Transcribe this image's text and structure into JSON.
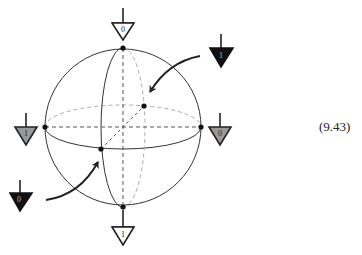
{
  "figure": {
    "type": "bloch-sphere-diagram",
    "equation_number": "(9.43)",
    "sphere": {
      "cx": 123,
      "cy": 127,
      "r": 78
    },
    "colors": {
      "line": "#333333",
      "dashed_back": "#aaaaaa",
      "dashed_axis": "#555555",
      "gray_fill": "#999999",
      "black_fill": "#111111",
      "white_fill": "#ffffff"
    },
    "states": [
      {
        "id": "top",
        "label": "0",
        "fill": "white",
        "position": "north pole"
      },
      {
        "id": "bottom",
        "label": "1",
        "fill": "white",
        "position": "south pole"
      },
      {
        "id": "left",
        "label": "1",
        "fill": "gray",
        "position": "west"
      },
      {
        "id": "right",
        "label": "0",
        "fill": "gray",
        "position": "east"
      },
      {
        "id": "back",
        "label": "1",
        "fill": "black",
        "position": "back (arrow from upper right)"
      },
      {
        "id": "front",
        "label": "0",
        "fill": "black",
        "position": "front (arrow from lower left)"
      }
    ]
  }
}
